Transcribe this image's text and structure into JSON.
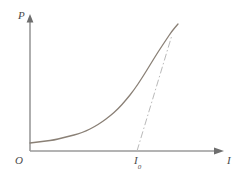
{
  "figure": {
    "background_color": "#ffffff",
    "width": 245,
    "height": 176
  },
  "labels": {
    "y_axis": "P",
    "x_axis": "I",
    "origin": "O",
    "tangent_intercept_base": "I",
    "tangent_intercept_sub": "0"
  },
  "colors": {
    "axis": "#9a9a9a",
    "curve": "#8a8076",
    "tangent": "#b9b9b9"
  },
  "chart_data": {
    "type": "line",
    "title": "",
    "xlabel": "I",
    "ylabel": "P",
    "grid": false,
    "legend": null,
    "axis_origin_label": "O",
    "annotations": [
      {
        "name": "tangent-intercept",
        "label": "I0",
        "x_pixel": 137,
        "y_pixel": 151
      }
    ],
    "series": [
      {
        "name": "P-I curve",
        "style": "solid",
        "color": "#8a8076",
        "points_pixel": [
          [
            30,
            143
          ],
          [
            38,
            142
          ],
          [
            46,
            141
          ],
          [
            54,
            140
          ],
          [
            62,
            138
          ],
          [
            70,
            136
          ],
          [
            78,
            134
          ],
          [
            86,
            131
          ],
          [
            94,
            127
          ],
          [
            102,
            122
          ],
          [
            110,
            116
          ],
          [
            118,
            109
          ],
          [
            126,
            100
          ],
          [
            134,
            90
          ],
          [
            142,
            78
          ],
          [
            150,
            65
          ],
          [
            158,
            52
          ],
          [
            166,
            40
          ],
          [
            172,
            31
          ],
          [
            178,
            24
          ]
        ]
      },
      {
        "name": "tangent-asymptote",
        "style": "dash-dot",
        "color": "#b9b9b9",
        "points_pixel": [
          [
            137,
            151
          ],
          [
            172,
            35
          ]
        ]
      }
    ],
    "axes_pixel": {
      "x_axis": {
        "x_start": 30,
        "x_end": 222,
        "y": 151
      },
      "y_axis": {
        "x": 30,
        "y_start": 151,
        "y_end": 17
      }
    }
  }
}
